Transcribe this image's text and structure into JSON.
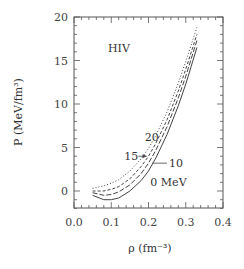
{
  "chart_data": {
    "type": "line",
    "title": "",
    "panel_label": "HIV",
    "xlabel": "ρ (fm⁻³)",
    "ylabel": "P (MeV/fm³)",
    "xlim": [
      0.0,
      0.4
    ],
    "ylim": [
      -2,
      20
    ],
    "xticks": [
      "0.0",
      "0.1",
      "0.2",
      "0.3",
      "0.4"
    ],
    "yticks": [
      "0",
      "5",
      "10",
      "15",
      "20"
    ],
    "grid": false,
    "legend": "none (curves annotated in-plot)",
    "series": [
      {
        "name": "0 MeV",
        "style": "solid",
        "x": [
          0.05,
          0.08,
          0.1,
          0.12,
          0.15,
          0.18,
          0.2,
          0.22,
          0.25,
          0.28,
          0.3,
          0.33
        ],
        "y": [
          -0.5,
          -1.0,
          -1.0,
          -0.8,
          0.0,
          1.2,
          2.3,
          3.8,
          6.5,
          9.8,
          12.3,
          16.5
        ]
      },
      {
        "name": "10 MeV",
        "style": "long-dash",
        "x": [
          0.05,
          0.08,
          0.1,
          0.12,
          0.15,
          0.18,
          0.2,
          0.22,
          0.25,
          0.28,
          0.3,
          0.33
        ],
        "y": [
          -0.2,
          -0.5,
          -0.4,
          -0.1,
          0.7,
          2.0,
          3.2,
          4.7,
          7.4,
          10.7,
          13.2,
          17.3
        ]
      },
      {
        "name": "15 MeV",
        "style": "short-dash",
        "x": [
          0.05,
          0.08,
          0.1,
          0.12,
          0.15,
          0.18,
          0.2,
          0.22,
          0.25,
          0.28,
          0.3,
          0.33
        ],
        "y": [
          0.0,
          0.0,
          0.2,
          0.5,
          1.4,
          2.8,
          4.0,
          5.5,
          8.2,
          11.5,
          14.0,
          18.0
        ]
      },
      {
        "name": "20 MeV",
        "style": "dotted",
        "x": [
          0.05,
          0.08,
          0.1,
          0.12,
          0.15,
          0.18,
          0.2,
          0.22,
          0.25,
          0.28,
          0.3,
          0.33
        ],
        "y": [
          0.3,
          0.6,
          0.9,
          1.3,
          2.3,
          3.7,
          4.9,
          6.4,
          9.1,
          12.4,
          14.9,
          18.8
        ]
      }
    ],
    "annotations": [
      {
        "text": "0 MeV",
        "x": 0.205,
        "y": 1.0
      },
      {
        "text": "10",
        "x": 0.255,
        "y": 3.2,
        "arrow_to": [
          0.21,
          3.2
        ]
      },
      {
        "text": "15",
        "x": 0.135,
        "y": 4.0,
        "arrow_to": [
          0.195,
          4.0
        ]
      },
      {
        "text": "20",
        "x": 0.19,
        "y": 6.2
      }
    ]
  }
}
